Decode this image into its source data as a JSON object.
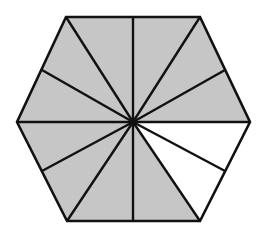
{
  "diagram": {
    "shape": "regular hexagon",
    "center": [
      133,
      122
    ],
    "vertices": [
      [
        66,
        17
      ],
      [
        200,
        17
      ],
      [
        250,
        122
      ],
      [
        200,
        221
      ],
      [
        67,
        221
      ],
      [
        17,
        122
      ]
    ],
    "edge_midpoints": [
      [
        133,
        17
      ],
      [
        225,
        70
      ],
      [
        225,
        171
      ],
      [
        133,
        221
      ],
      [
        42,
        171
      ],
      [
        42,
        70
      ]
    ],
    "total_parts": 12,
    "shaded_parts": 10,
    "unshaded_parts": 2,
    "colors": {
      "shaded": "#c6c6c6",
      "unshaded": "#ffffff",
      "stroke": "#111111"
    },
    "triangles": [
      {
        "id": 1,
        "points": [
          [
            133,
            122
          ],
          [
            133,
            17
          ],
          [
            200,
            17
          ]
        ],
        "shaded": true
      },
      {
        "id": 2,
        "points": [
          [
            133,
            122
          ],
          [
            200,
            17
          ],
          [
            225,
            70
          ]
        ],
        "shaded": true
      },
      {
        "id": 3,
        "points": [
          [
            133,
            122
          ],
          [
            225,
            70
          ],
          [
            250,
            122
          ]
        ],
        "shaded": true
      },
      {
        "id": 4,
        "points": [
          [
            133,
            122
          ],
          [
            250,
            122
          ],
          [
            225,
            171
          ]
        ],
        "shaded": false
      },
      {
        "id": 5,
        "points": [
          [
            133,
            122
          ],
          [
            225,
            171
          ],
          [
            200,
            221
          ]
        ],
        "shaded": false
      },
      {
        "id": 6,
        "points": [
          [
            133,
            122
          ],
          [
            200,
            221
          ],
          [
            133,
            221
          ]
        ],
        "shaded": true
      },
      {
        "id": 7,
        "points": [
          [
            133,
            122
          ],
          [
            133,
            221
          ],
          [
            67,
            221
          ]
        ],
        "shaded": true
      },
      {
        "id": 8,
        "points": [
          [
            133,
            122
          ],
          [
            67,
            221
          ],
          [
            42,
            171
          ]
        ],
        "shaded": true
      },
      {
        "id": 9,
        "points": [
          [
            133,
            122
          ],
          [
            42,
            171
          ],
          [
            17,
            122
          ]
        ],
        "shaded": true
      },
      {
        "id": 10,
        "points": [
          [
            133,
            122
          ],
          [
            17,
            122
          ],
          [
            42,
            70
          ]
        ],
        "shaded": true
      },
      {
        "id": 11,
        "points": [
          [
            133,
            122
          ],
          [
            42,
            70
          ],
          [
            66,
            17
          ]
        ],
        "shaded": true
      },
      {
        "id": 12,
        "points": [
          [
            133,
            122
          ],
          [
            66,
            17
          ],
          [
            133,
            17
          ]
        ],
        "shaded": true
      }
    ]
  }
}
